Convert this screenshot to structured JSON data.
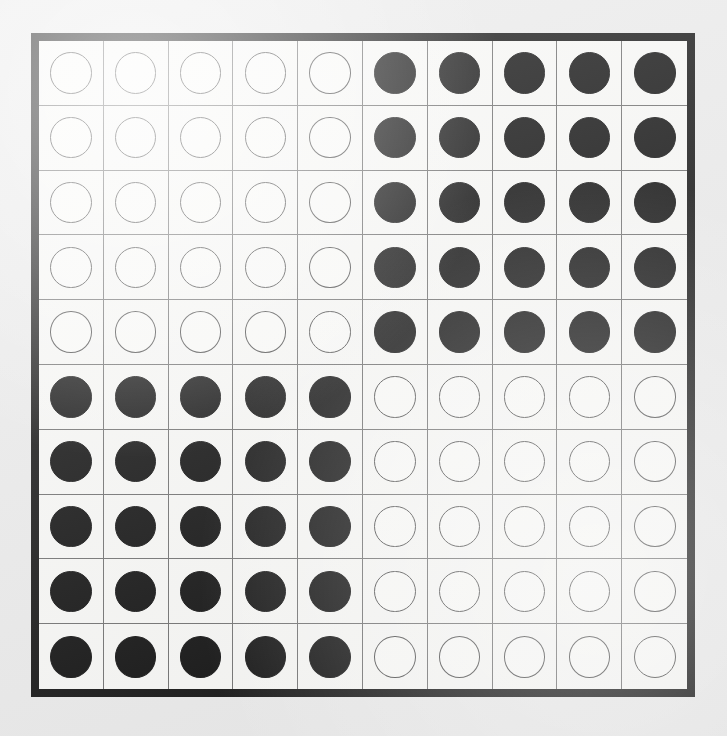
{
  "board": {
    "title": "Checkerboard of pieces",
    "rows": 10,
    "columns": 10,
    "frame_color": "#121212",
    "cell_color": "#f8f8f6",
    "grid_line_color": "#6e6e6e",
    "page_background": "#ebebeb",
    "piece_white_fill": "#fbfbf9",
    "piece_white_stroke": "#4a4a4a",
    "piece_black_fill": "#0e0e0e",
    "counts": {
      "white": 50,
      "black": 50,
      "total": 100
    },
    "pattern_description": "2x2 arrangement of 5x5 blocks: top-left white, top-right black, bottom-left black, bottom-right white",
    "cells": [
      [
        "white",
        "white",
        "white",
        "white",
        "white",
        "black",
        "black",
        "black",
        "black",
        "black"
      ],
      [
        "white",
        "white",
        "white",
        "white",
        "white",
        "black",
        "black",
        "black",
        "black",
        "black"
      ],
      [
        "white",
        "white",
        "white",
        "white",
        "white",
        "black",
        "black",
        "black",
        "black",
        "black"
      ],
      [
        "white",
        "white",
        "white",
        "white",
        "white",
        "black",
        "black",
        "black",
        "black",
        "black"
      ],
      [
        "white",
        "white",
        "white",
        "white",
        "white",
        "black",
        "black",
        "black",
        "black",
        "black"
      ],
      [
        "black",
        "black",
        "black",
        "black",
        "black",
        "white",
        "white",
        "white",
        "white",
        "white"
      ],
      [
        "black",
        "black",
        "black",
        "black",
        "black",
        "white",
        "white",
        "white",
        "white",
        "white"
      ],
      [
        "black",
        "black",
        "black",
        "black",
        "black",
        "white",
        "white",
        "white",
        "white",
        "white"
      ],
      [
        "black",
        "black",
        "black",
        "black",
        "black",
        "white",
        "white",
        "white",
        "white",
        "white"
      ],
      [
        "black",
        "black",
        "black",
        "black",
        "black",
        "white",
        "white",
        "white",
        "white",
        "white"
      ]
    ]
  }
}
